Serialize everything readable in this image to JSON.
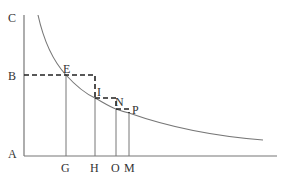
{
  "diagram": {
    "type": "geometric-construction",
    "labels": {
      "C": "C",
      "B": "B",
      "A": "A",
      "E": "E",
      "I": "I",
      "N": "N",
      "P": "P",
      "G": "G",
      "H": "H",
      "O": "O",
      "M": "M"
    },
    "colors": {
      "line": "#777777",
      "dash": "#222222",
      "text": "#333333"
    }
  }
}
